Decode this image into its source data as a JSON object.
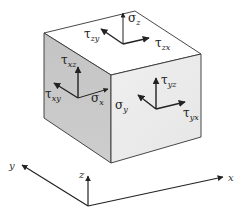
{
  "diagram": {
    "title": "",
    "type": "stress-element-3d",
    "colors": {
      "top_face": "#ffffff",
      "left_face": "#c9c9c9",
      "right_face": "#ececec",
      "edge": "#333333",
      "arrow": "#222222"
    },
    "cube": {
      "vertices": {
        "top_back": [
          135,
          11
        ],
        "top_left": [
          44,
          33
        ],
        "top_right": [
          201,
          54
        ],
        "top_front": [
          111,
          75
        ],
        "bottom_left": [
          44,
          118
        ],
        "bottom_front": [
          111,
          163
        ],
        "bottom_right": [
          201,
          137
        ]
      }
    },
    "faces": {
      "top": {
        "name": "z-face",
        "origin": [
          123,
          44
        ],
        "arrows": [
          {
            "id": "sigma_z",
            "symbol": "σ",
            "subscript": "z",
            "to": [
              123,
              13
            ],
            "label_pos": [
              128,
              22
            ]
          },
          {
            "id": "tau_zy",
            "symbol": "τ",
            "subscript": "zy",
            "to": [
              101,
              29
            ],
            "label_pos": [
              84,
              38
            ]
          },
          {
            "id": "tau_zx",
            "symbol": "τ",
            "subscript": "zx",
            "to": [
              149,
              38
            ],
            "label_pos": [
              156,
              47
            ]
          }
        ]
      },
      "left": {
        "name": "x-face",
        "origin": [
          78,
          98
        ],
        "arrows": [
          {
            "id": "tau_xz",
            "symbol": "τ",
            "subscript": "xz",
            "to": [
              78,
              67
            ],
            "label_pos": [
              61,
              62
            ]
          },
          {
            "id": "tau_xy",
            "symbol": "τ",
            "subscript": "xy",
            "to": [
              54,
              83
            ],
            "label_pos": [
              45,
              100
            ]
          },
          {
            "id": "sigma_x",
            "symbol": "σ",
            "subscript": "x",
            "to": [
              108,
              89
            ],
            "label_pos": [
              91,
              104
            ]
          }
        ]
      },
      "right": {
        "name": "y-face",
        "origin": [
          156,
          109
        ],
        "arrows": [
          {
            "id": "tau_yz",
            "symbol": "τ",
            "subscript": "yz",
            "to": [
              156,
              78
            ],
            "label_pos": [
              161,
              83
            ]
          },
          {
            "id": "sigma_y",
            "symbol": "σ",
            "subscript": "y",
            "to": [
              138,
              95
            ],
            "label_pos": [
              115,
              110
            ]
          },
          {
            "id": "tau_yx",
            "symbol": "τ",
            "subscript": "yx",
            "to": [
              185,
              102
            ],
            "label_pos": [
              183,
              120
            ]
          }
        ]
      }
    },
    "axes": {
      "origin": [
        88,
        206
      ],
      "x": {
        "label": "x",
        "to": [
          223,
          177
        ],
        "label_pos": [
          228,
          181
        ]
      },
      "y": {
        "label": "y",
        "to": [
          22,
          165
        ],
        "label_pos": [
          9,
          169
        ]
      },
      "z": {
        "label": "z",
        "to": [
          88,
          176
        ],
        "label_pos": [
          79,
          178
        ]
      }
    },
    "labels": {
      "sigma_z": {
        "symbol": "σ",
        "sub": "z"
      },
      "tau_zy": {
        "symbol": "τ",
        "sub": "zy"
      },
      "tau_zx": {
        "symbol": "τ",
        "sub": "zx"
      },
      "tau_xz": {
        "symbol": "τ",
        "sub": "xz"
      },
      "tau_xy": {
        "symbol": "τ",
        "sub": "xy"
      },
      "sigma_x": {
        "symbol": "σ",
        "sub": "x"
      },
      "tau_yz": {
        "symbol": "τ",
        "sub": "yz"
      },
      "sigma_y": {
        "symbol": "σ",
        "sub": "y"
      },
      "tau_yx": {
        "symbol": "τ",
        "sub": "yx"
      },
      "axis_x": "x",
      "axis_y": "y",
      "axis_z": "z"
    }
  }
}
